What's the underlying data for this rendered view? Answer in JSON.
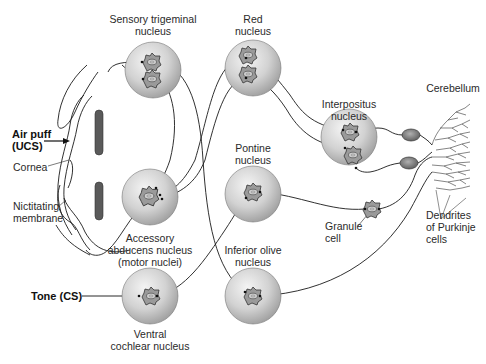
{
  "diagram": {
    "type": "neural-circuit",
    "stimuli": {
      "ucs": {
        "line1": "Air puff",
        "line2": "(UCS)"
      },
      "cs": {
        "label": "Tone (CS)"
      }
    },
    "eye_structures": {
      "cornea": "Cornea",
      "nictitating_membrane": {
        "line1": "Nictitating",
        "line2": "membrane"
      }
    },
    "nuclei": [
      {
        "id": "sensory-trigeminal",
        "line1": "Sensory trigeminal",
        "line2": "nucleus",
        "neurons": 2
      },
      {
        "id": "red",
        "line1": "Red",
        "line2": "nucleus",
        "neurons": 2
      },
      {
        "id": "interpositus",
        "line1": "Interpositus",
        "line2": "nucleus",
        "neurons": 2
      },
      {
        "id": "accessory-abducens",
        "line1": "Accessory",
        "line2": "abducens nucleus",
        "line3": "(motor nuclei)",
        "neurons": 1
      },
      {
        "id": "pontine",
        "line1": "Pontine",
        "line2": "nucleus",
        "neurons": 1
      },
      {
        "id": "ventral-cochlear",
        "line1": "Ventral",
        "line2": "cochlear nucleus",
        "neurons": 1
      },
      {
        "id": "inferior-olive",
        "line1": "Inferior olive",
        "line2": "nucleus",
        "neurons": 1
      }
    ],
    "cerebellum": {
      "title": "Cerebellum",
      "granule_cell": {
        "line1": "Granule",
        "line2": "cell"
      },
      "purkinje_dendrites": {
        "line1": "Dendrites",
        "line2": "of Purkinje",
        "line3": "cells"
      }
    },
    "connections": [
      {
        "from": "air-puff",
        "to": "sensory-trigeminal"
      },
      {
        "from": "sensory-trigeminal",
        "to": "accessory-abducens"
      },
      {
        "from": "sensory-trigeminal",
        "to": "inferior-olive"
      },
      {
        "from": "inferior-olive",
        "to": "purkinje-cells (climbing fiber)"
      },
      {
        "from": "tone",
        "to": "ventral-cochlear"
      },
      {
        "from": "ventral-cochlear",
        "to": "pontine"
      },
      {
        "from": "pontine",
        "to": "granule-cell"
      },
      {
        "from": "granule-cell",
        "to": "purkinje-cells (parallel fibers)"
      },
      {
        "from": "purkinje-cells",
        "to": "interpositus"
      },
      {
        "from": "interpositus",
        "to": "red"
      },
      {
        "from": "red",
        "to": "accessory-abducens"
      },
      {
        "from": "accessory-abducens",
        "to": "nictitating-membrane"
      }
    ],
    "colors": {
      "nucleus_fill_light": "#f2f2f2",
      "nucleus_fill_dark": "#9a9a9a",
      "neuron_fill": "#a8a8a8",
      "purkinje_fill": "#7a7a7a",
      "eyelid_fill": "#5a5a5a",
      "line": "#1a1a1a"
    }
  },
  "caption": {
    "visible": "truncated",
    "text": ""
  }
}
